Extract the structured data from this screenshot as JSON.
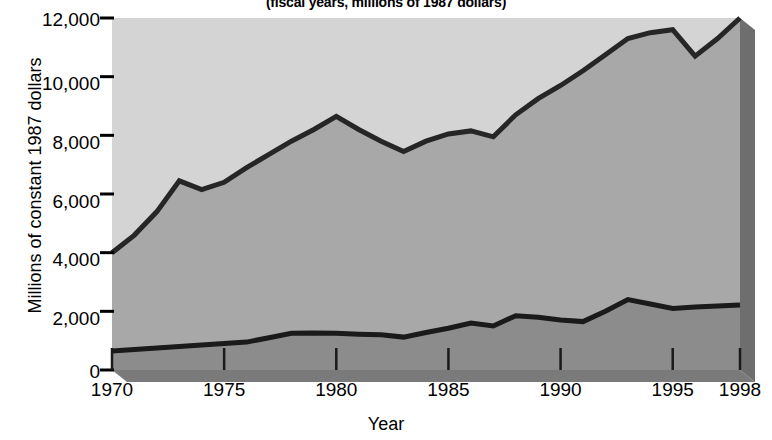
{
  "chart_data": {
    "type": "area",
    "title": "",
    "subtitle": "(fiscal years, millions of 1987 dollars)",
    "xlabel": "Year",
    "ylabel": "Millions of constant 1987 dollars",
    "xlim": [
      1970,
      1998
    ],
    "ylim": [
      0,
      12000
    ],
    "grid": false,
    "legend": "none",
    "stacked": true,
    "ytick_labels": [
      "12,000",
      "10,000",
      "8,000",
      "6,000",
      "4,000",
      "2,000",
      "0"
    ],
    "ytick_values": [
      12000,
      10000,
      8000,
      6000,
      4000,
      2000,
      0
    ],
    "xtick_labels": [
      "1970",
      "1975",
      "1980",
      "1985",
      "1990",
      "1995",
      "1998"
    ],
    "xtick_values": [
      1970,
      1975,
      1980,
      1985,
      1990,
      1995,
      1998
    ],
    "x": [
      1970,
      1971,
      1972,
      1973,
      1974,
      1975,
      1976,
      1977,
      1978,
      1979,
      1980,
      1981,
      1982,
      1983,
      1984,
      1985,
      1986,
      1987,
      1988,
      1989,
      1990,
      1991,
      1992,
      1993,
      1994,
      1995,
      1996,
      1997,
      1998
    ],
    "series": [
      {
        "name": "lower-band",
        "values": [
          650,
          700,
          750,
          800,
          850,
          900,
          950,
          1100,
          1250,
          1260,
          1250,
          1220,
          1200,
          1120,
          1280,
          1420,
          1600,
          1500,
          1850,
          1800,
          1700,
          1650,
          2000,
          2400,
          2250,
          2100,
          2150,
          2180,
          2220
        ]
      },
      {
        "name": "upper-total",
        "values": [
          4000,
          4600,
          5400,
          6450,
          6150,
          6400,
          6900,
          7350,
          7800,
          8200,
          8650,
          8200,
          7800,
          7450,
          7800,
          8050,
          8150,
          7950,
          8700,
          9250,
          9700,
          10200,
          10750,
          11300,
          11500,
          11600,
          10700,
          11300,
          12000
        ]
      }
    ],
    "colors": {
      "upper_band_fill": "#d4d4d4",
      "lower_band_fill": "#a8a8a8",
      "base_band_fill": "#8c8c8c",
      "line": "#262626",
      "shadow": "#6e6e6e",
      "text": "#000000",
      "background": "#ffffff"
    }
  }
}
